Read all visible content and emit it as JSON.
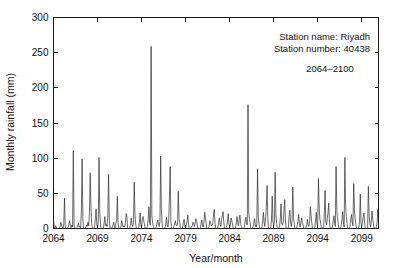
{
  "figure": {
    "background_color": "#ffffff",
    "axis_color": "#1a1a1a",
    "series_color": "#2b2b2b"
  },
  "annotations": {
    "station_name": "Station name: Riyadh",
    "station_number": "Station number: 40438",
    "period": "2064–2100"
  },
  "chart_data": {
    "type": "line",
    "title": "",
    "xlabel": "Year/month",
    "ylabel": "Monthly rainfall (mm)",
    "xlim": [
      2064,
      2100.9
    ],
    "ylim": [
      0,
      300
    ],
    "grid": false,
    "legend": null,
    "x_tick_labels": [
      "2064",
      "2069",
      "2074",
      "2079",
      "2084",
      "2089",
      "2094",
      "2099"
    ],
    "x_tick_values": [
      2064,
      2069,
      2074,
      2079,
      2084,
      2089,
      2094,
      2099
    ],
    "y_tick_labels": [
      "0",
      "50",
      "100",
      "150",
      "200",
      "250",
      "300"
    ],
    "y_tick_values": [
      0,
      50,
      100,
      150,
      200,
      250,
      300
    ],
    "x_start_year": 2064,
    "x_step_months": 1,
    "series": [
      {
        "name": "Monthly rainfall",
        "units": "mm",
        "values": [
          11,
          2,
          0,
          4,
          1,
          0,
          0,
          0,
          1,
          3,
          9,
          5,
          2,
          0,
          7,
          43,
          2,
          0,
          0,
          0,
          2,
          6,
          11,
          3,
          1,
          5,
          2,
          111,
          6,
          0,
          0,
          0,
          1,
          4,
          8,
          2,
          3,
          1,
          26,
          99,
          14,
          0,
          0,
          0,
          2,
          5,
          3,
          9,
          4,
          23,
          79,
          33,
          7,
          0,
          0,
          0,
          3,
          14,
          28,
          6,
          2,
          9,
          101,
          24,
          5,
          0,
          0,
          0,
          1,
          8,
          17,
          4,
          6,
          3,
          18,
          77,
          12,
          0,
          0,
          0,
          2,
          5,
          9,
          3,
          1,
          7,
          12,
          46,
          8,
          0,
          0,
          0,
          3,
          11,
          6,
          2,
          4,
          2,
          9,
          21,
          17,
          0,
          0,
          0,
          1,
          7,
          15,
          5,
          3,
          8,
          66,
          19,
          6,
          0,
          0,
          0,
          2,
          9,
          22,
          4,
          2,
          14,
          17,
          11,
          5,
          0,
          0,
          0,
          4,
          13,
          31,
          7,
          5,
          259,
          18,
          9,
          3,
          0,
          0,
          0,
          2,
          8,
          12,
          6,
          3,
          10,
          103,
          27,
          7,
          0,
          0,
          0,
          1,
          6,
          16,
          4,
          2,
          12,
          46,
          88,
          9,
          0,
          0,
          0,
          3,
          7,
          11,
          5,
          4,
          6,
          53,
          14,
          8,
          0,
          0,
          0,
          2,
          9,
          13,
          3,
          1,
          5,
          11,
          19,
          6,
          0,
          0,
          0,
          2,
          4,
          9,
          7,
          3,
          8,
          14,
          10,
          4,
          0,
          0,
          0,
          1,
          6,
          12,
          5,
          2,
          9,
          23,
          16,
          7,
          0,
          0,
          0,
          3,
          11,
          8,
          4,
          5,
          7,
          20,
          27,
          9,
          0,
          0,
          0,
          2,
          8,
          15,
          6,
          3,
          12,
          18,
          24,
          10,
          0,
          0,
          0,
          4,
          9,
          21,
          7,
          2,
          6,
          15,
          11,
          5,
          0,
          0,
          0,
          1,
          8,
          17,
          9,
          4,
          13,
          19,
          7,
          3,
          0,
          0,
          0,
          2,
          10,
          16,
          6,
          5,
          176,
          22,
          12,
          8,
          0,
          0,
          0,
          3,
          9,
          14,
          5,
          2,
          7,
          85,
          18,
          6,
          0,
          0,
          0,
          1,
          11,
          23,
          8,
          3,
          15,
          30,
          61,
          13,
          0,
          0,
          0,
          2,
          12,
          46,
          9,
          4,
          10,
          80,
          21,
          7,
          0,
          0,
          0,
          3,
          14,
          35,
          6,
          5,
          9,
          27,
          41,
          11,
          0,
          0,
          0,
          2,
          17,
          26,
          8,
          3,
          12,
          59,
          16,
          6,
          0,
          0,
          0,
          4,
          10,
          20,
          7,
          2,
          8,
          15,
          9,
          5,
          0,
          0,
          0,
          1,
          6,
          13,
          4,
          3,
          11,
          31,
          18,
          7,
          0,
          0,
          0,
          2,
          9,
          23,
          6,
          4,
          71,
          28,
          13,
          8,
          0,
          0,
          0,
          3,
          21,
          54,
          10,
          5,
          14,
          22,
          36,
          9,
          0,
          0,
          0,
          2,
          11,
          18,
          7,
          3,
          88,
          26,
          15,
          6,
          0,
          0,
          0,
          4,
          13,
          24,
          8,
          2,
          101,
          31,
          17,
          7,
          0,
          0,
          0,
          3,
          12,
          20,
          9,
          4,
          64,
          27,
          14,
          5,
          0,
          0,
          0,
          2,
          10,
          49,
          8,
          3,
          9,
          17,
          22,
          6,
          0,
          0,
          0,
          1,
          60,
          19,
          7,
          2,
          11,
          25,
          13,
          5,
          0,
          0,
          0,
          3,
          9,
          28,
          6
        ]
      }
    ]
  }
}
